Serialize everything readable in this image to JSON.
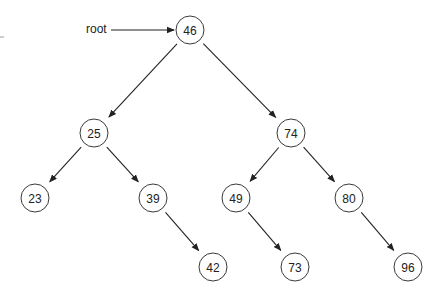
{
  "diagram": {
    "type": "binary-search-tree",
    "pointer_label": "root",
    "pointer_target": "n46",
    "nodes": [
      {
        "id": "n46",
        "label": "46"
      },
      {
        "id": "n25",
        "label": "25"
      },
      {
        "id": "n74",
        "label": "74"
      },
      {
        "id": "n23",
        "label": "23"
      },
      {
        "id": "n39",
        "label": "39"
      },
      {
        "id": "n49",
        "label": "49"
      },
      {
        "id": "n80",
        "label": "80"
      },
      {
        "id": "n42",
        "label": "42"
      },
      {
        "id": "n73",
        "label": "73"
      },
      {
        "id": "n96",
        "label": "96"
      }
    ],
    "edges": [
      {
        "from": "n46",
        "to": "n25"
      },
      {
        "from": "n46",
        "to": "n74"
      },
      {
        "from": "n25",
        "to": "n23"
      },
      {
        "from": "n25",
        "to": "n39"
      },
      {
        "from": "n74",
        "to": "n49"
      },
      {
        "from": "n74",
        "to": "n80"
      },
      {
        "from": "n39",
        "to": "n42"
      },
      {
        "from": "n49",
        "to": "n73"
      },
      {
        "from": "n80",
        "to": "n96"
      }
    ]
  }
}
